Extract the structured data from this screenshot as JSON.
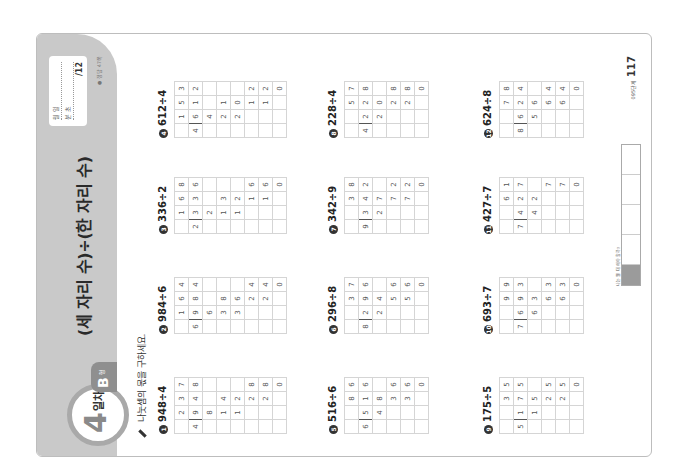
{
  "header": {
    "day_number": "4",
    "day_label": "일차",
    "level_letter": "B",
    "level_suffix": "형",
    "title": "(세 자리 수)÷(한 자리 수)",
    "score_box": {
      "row1": "월     일",
      "row2": "분     초",
      "total": "/12"
    },
    "answer_ref": "● 정답 47쪽"
  },
  "instruction": "나눗셈의 몫을 구하세요.",
  "problems": [
    {
      "num": "1",
      "expr": "948÷4",
      "divisor": "4",
      "rows": [
        [
          "",
          "2",
          "3",
          "7"
        ],
        [
          "4",
          "9",
          "4",
          "8"
        ],
        [
          "",
          "8",
          "",
          ""
        ],
        [
          "",
          "1",
          "4",
          ""
        ],
        [
          "",
          "1",
          "2",
          ""
        ],
        [
          "",
          "",
          "2",
          "8"
        ],
        [
          "",
          "",
          "2",
          "8"
        ],
        [
          "",
          "",
          "",
          "0"
        ]
      ]
    },
    {
      "num": "2",
      "expr": "984÷6",
      "divisor": "6",
      "rows": [
        [
          "",
          "1",
          "6",
          "4"
        ],
        [
          "6",
          "9",
          "8",
          "4"
        ],
        [
          "",
          "6",
          "",
          ""
        ],
        [
          "",
          "3",
          "8",
          ""
        ],
        [
          "",
          "3",
          "6",
          ""
        ],
        [
          "",
          "",
          "2",
          "4"
        ],
        [
          "",
          "",
          "2",
          "4"
        ],
        [
          "",
          "",
          "",
          "0"
        ]
      ]
    },
    {
      "num": "3",
      "expr": "336÷2",
      "divisor": "2",
      "rows": [
        [
          "",
          "1",
          "6",
          "8"
        ],
        [
          "2",
          "3",
          "3",
          "6"
        ],
        [
          "",
          "2",
          "",
          ""
        ],
        [
          "",
          "1",
          "3",
          ""
        ],
        [
          "",
          "1",
          "2",
          ""
        ],
        [
          "",
          "",
          "1",
          "6"
        ],
        [
          "",
          "",
          "1",
          "6"
        ],
        [
          "",
          "",
          "",
          "0"
        ]
      ]
    },
    {
      "num": "4",
      "expr": "612÷4",
      "divisor": "4",
      "rows": [
        [
          "",
          "1",
          "5",
          "3"
        ],
        [
          "4",
          "6",
          "1",
          "2"
        ],
        [
          "",
          "4",
          "",
          ""
        ],
        [
          "",
          "2",
          "1",
          ""
        ],
        [
          "",
          "2",
          "0",
          ""
        ],
        [
          "",
          "",
          "1",
          "2"
        ],
        [
          "",
          "",
          "1",
          "2"
        ],
        [
          "",
          "",
          "",
          "0"
        ]
      ]
    },
    {
      "num": "5",
      "expr": "516÷6",
      "divisor": "6",
      "rows": [
        [
          "",
          "",
          "8",
          "6"
        ],
        [
          "6",
          "5",
          "1",
          "6"
        ],
        [
          "",
          "4",
          "8",
          ""
        ],
        [
          "",
          "",
          "3",
          "6"
        ],
        [
          "",
          "",
          "3",
          "6"
        ],
        [
          "",
          "",
          "",
          "0"
        ]
      ]
    },
    {
      "num": "6",
      "expr": "296÷8",
      "divisor": "8",
      "rows": [
        [
          "",
          "",
          "3",
          "7"
        ],
        [
          "8",
          "2",
          "9",
          "6"
        ],
        [
          "",
          "2",
          "4",
          ""
        ],
        [
          "",
          "",
          "5",
          "6"
        ],
        [
          "",
          "",
          "5",
          "6"
        ],
        [
          "",
          "",
          "",
          "0"
        ]
      ]
    },
    {
      "num": "7",
      "expr": "342÷9",
      "divisor": "9",
      "rows": [
        [
          "",
          "",
          "3",
          "8"
        ],
        [
          "9",
          "3",
          "4",
          "2"
        ],
        [
          "",
          "2",
          "7",
          ""
        ],
        [
          "",
          "",
          "7",
          "2"
        ],
        [
          "",
          "",
          "7",
          "2"
        ],
        [
          "",
          "",
          "",
          "0"
        ]
      ]
    },
    {
      "num": "8",
      "expr": "228÷4",
      "divisor": "4",
      "rows": [
        [
          "",
          "",
          "5",
          "7"
        ],
        [
          "4",
          "2",
          "2",
          "8"
        ],
        [
          "",
          "2",
          "0",
          ""
        ],
        [
          "",
          "",
          "2",
          "8"
        ],
        [
          "",
          "",
          "2",
          "8"
        ],
        [
          "",
          "",
          "",
          "0"
        ]
      ]
    },
    {
      "num": "9",
      "expr": "175÷5",
      "divisor": "5",
      "rows": [
        [
          "",
          "",
          "3",
          "5"
        ],
        [
          "5",
          "1",
          "7",
          "5"
        ],
        [
          "",
          "1",
          "5",
          ""
        ],
        [
          "",
          "",
          "2",
          "5"
        ],
        [
          "",
          "",
          "2",
          "5"
        ],
        [
          "",
          "",
          "",
          "0"
        ]
      ]
    },
    {
      "num": "10",
      "expr": "693÷7",
      "divisor": "7",
      "rows": [
        [
          "",
          "",
          "9",
          "9"
        ],
        [
          "7",
          "6",
          "9",
          "3"
        ],
        [
          "",
          "6",
          "3",
          ""
        ],
        [
          "",
          "",
          "6",
          "3"
        ],
        [
          "",
          "",
          "6",
          "3"
        ],
        [
          "",
          "",
          "",
          "0"
        ]
      ]
    },
    {
      "num": "11",
      "expr": "427÷7",
      "divisor": "7",
      "rows": [
        [
          "",
          "",
          "6",
          "1"
        ],
        [
          "7",
          "4",
          "2",
          "7"
        ],
        [
          "",
          "4",
          "2",
          ""
        ],
        [
          "",
          "",
          "",
          "7"
        ],
        [
          "",
          "",
          "",
          "7"
        ],
        [
          "",
          "",
          "",
          "0"
        ]
      ]
    },
    {
      "num": "12",
      "expr": "624÷8",
      "divisor": "8",
      "rows": [
        [
          "",
          "",
          "7",
          "8"
        ],
        [
          "8",
          "6",
          "2",
          "4"
        ],
        [
          "",
          "5",
          "6",
          ""
        ],
        [
          "",
          "",
          "6",
          "4"
        ],
        [
          "",
          "",
          "6",
          "4"
        ],
        [
          "",
          "",
          "",
          "0"
        ]
      ]
    }
  ],
  "footer": {
    "note": "나는 뭘 더 해야 할까?",
    "table_head": "자기 평가",
    "page_label": "095단계",
    "page_number": "117"
  }
}
